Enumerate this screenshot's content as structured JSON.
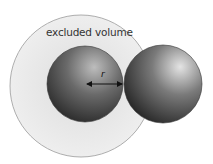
{
  "diagram": {
    "label_excluded_volume": "excluded volume",
    "label_radius": "r",
    "colors": {
      "excluded_fill": "#e6e6e6",
      "excluded_stroke": "#8a8a8a",
      "sphere_dark": "#2a2a2a",
      "sphere_light": "#d8d8d8"
    }
  }
}
